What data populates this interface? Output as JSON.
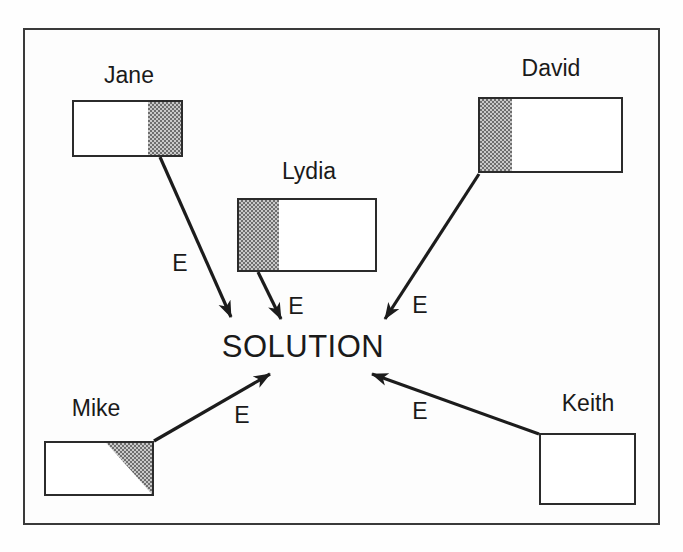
{
  "diagram": {
    "center": {
      "label": "SOLUTION"
    },
    "people": [
      {
        "name": "Jane",
        "shading": "right-strip",
        "arrow_label": "E"
      },
      {
        "name": "Lydia",
        "shading": "left-strip",
        "arrow_label": "E"
      },
      {
        "name": "David",
        "shading": "left-strip",
        "arrow_label": "E"
      },
      {
        "name": "Mike",
        "shading": "top-right-triangle",
        "arrow_label": "E"
      },
      {
        "name": "Keith",
        "shading": "none",
        "arrow_label": "E"
      }
    ],
    "colors": {
      "line": "#1c1c1c",
      "frame_border": "#3a3a3a",
      "shade_dark": "#6e6e6e",
      "shade_light": "#c9c9c9",
      "background": "#fdfdfd"
    }
  }
}
